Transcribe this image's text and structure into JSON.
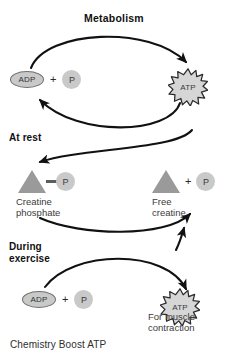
{
  "figure": {
    "caption": "Chemistry Boost ATP",
    "sections": [
      {
        "id": "metabolism",
        "title": "Metabolism"
      },
      {
        "id": "at-rest",
        "title": "At rest"
      },
      {
        "id": "during-exercise",
        "title": "During\nexercise"
      }
    ],
    "nodes": {
      "adp_top": {
        "label": "ADP",
        "shape": "ellipse"
      },
      "plus_top": {
        "label": "+"
      },
      "phosphate_top": {
        "label": "P",
        "shape": "circle"
      },
      "atp_top": {
        "label": "ATP",
        "shape": "starburst"
      },
      "creatine_phosphate_triangle": {
        "label": "",
        "shape": "triangle"
      },
      "creatine_phosphate_p": {
        "label": "P",
        "shape": "circle"
      },
      "creatine_phosphate_label": {
        "label": "Creatine\nphosphate"
      },
      "free_creatine_triangle": {
        "label": "",
        "shape": "triangle"
      },
      "plus_mid": {
        "label": "+"
      },
      "free_creatine_p": {
        "label": "P",
        "shape": "circle"
      },
      "free_creatine_label": {
        "label": "Free\ncreatine"
      },
      "adp_bottom": {
        "label": "ADP",
        "shape": "ellipse"
      },
      "plus_bottom": {
        "label": "+"
      },
      "phosphate_bottom": {
        "label": "P",
        "shape": "circle"
      },
      "atp_bottom": {
        "label": "ATP",
        "shape": "starburst"
      },
      "atp_bottom_label": {
        "label": "For muscle\ncontraction"
      }
    },
    "colors": {
      "background": "#ffffff",
      "arrow": "#111111",
      "molecule_fill": "#c9c9c9",
      "molecule_stroke": "#6f6f6f",
      "triangle_fill": "#9a9a9a",
      "burst_fill": "#d6d6d6",
      "burst_stroke": "#2b2b2b",
      "text": "#1a1a1a",
      "label_text": "#3b3b3b"
    }
  }
}
